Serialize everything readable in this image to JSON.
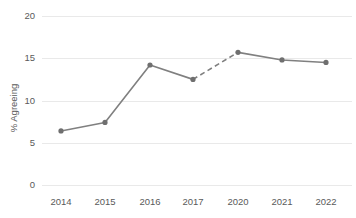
{
  "chart_data": {
    "type": "line",
    "title": "",
    "subtitle": "",
    "xlabel": "",
    "ylabel": "% Agreeing",
    "categories": [
      "2014",
      "2015",
      "2016",
      "2017",
      "2020",
      "2021",
      "2022"
    ],
    "values": [
      6.4,
      7.4,
      14.2,
      12.5,
      15.7,
      14.8,
      14.5
    ],
    "series": [
      {
        "name": "% Agreeing",
        "values": [
          6.4,
          7.4,
          14.2,
          12.5,
          15.7,
          14.8,
          14.5
        ]
      }
    ],
    "ylim": [
      0,
      20
    ],
    "yticks": [
      0,
      5,
      10,
      15,
      20
    ],
    "ytick_labels": [
      "0",
      "5",
      "10",
      "15",
      "20"
    ],
    "xtick_labels": [
      "2014",
      "2015",
      "2016",
      "2017",
      "2020",
      "2021",
      "2022"
    ],
    "grid": "horizontal",
    "legend": "none",
    "annotations": [
      "Dashed line segment between 2017 and 2020 indicates missing data for 2018 and 2019"
    ],
    "dashed_segments": [
      [
        3,
        4
      ]
    ],
    "colors": {
      "line": "#808080",
      "marker": "#6f6f6f",
      "gridline": "#e9e9e9",
      "tick_label": "#5a5a5a",
      "background": "#ffffff"
    }
  },
  "ytick_positions": {
    "0": 185,
    "5": 143,
    "10": 101,
    "15": 58,
    "20": 16
  },
  "xtick_positions": {
    "2014": 61,
    "2015": 105,
    "2016": 150,
    "2017": 193,
    "2020": 238,
    "2021": 282,
    "2022": 326
  },
  "labels": {
    "y_axis_title": "% Agreeing",
    "y_0": "0",
    "y_5": "5",
    "y_10": "10",
    "y_15": "15",
    "y_20": "20",
    "x_2014": "2014",
    "x_2015": "2015",
    "x_2016": "2016",
    "x_2017": "2017",
    "x_2020": "2020",
    "x_2021": "2021",
    "x_2022": "2022"
  }
}
